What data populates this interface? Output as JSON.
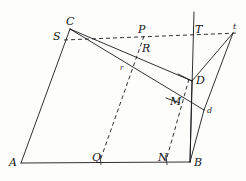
{
  "figure": {
    "kind": "geometry-diagram",
    "width": 246,
    "height": 181,
    "background_color": "#fdfdfb",
    "stroke_color": "#1a1a1e",
    "labels": [
      {
        "id": "C",
        "text": "C",
        "x": 66,
        "y": 16,
        "size": "lg"
      },
      {
        "id": "S",
        "text": "S",
        "x": 53,
        "y": 31,
        "size": "lg"
      },
      {
        "id": "P",
        "text": "P",
        "x": 138,
        "y": 24,
        "size": "lg"
      },
      {
        "id": "T",
        "text": "T",
        "x": 195,
        "y": 24,
        "size": "lg"
      },
      {
        "id": "t",
        "text": "t",
        "x": 233,
        "y": 23,
        "size": "sm"
      },
      {
        "id": "R",
        "text": "R",
        "x": 142,
        "y": 43,
        "size": "lg"
      },
      {
        "id": "r",
        "text": "r",
        "x": 120,
        "y": 65,
        "size": "xs"
      },
      {
        "id": "D",
        "text": "D",
        "x": 196,
        "y": 75,
        "size": "lg"
      },
      {
        "id": "M",
        "text": "M",
        "x": 170,
        "y": 96,
        "size": "lg"
      },
      {
        "id": "d",
        "text": "d",
        "x": 207,
        "y": 107,
        "size": "sm"
      },
      {
        "id": "A",
        "text": "A",
        "x": 9,
        "y": 157,
        "size": "lg"
      },
      {
        "id": "Q",
        "text": "Q",
        "x": 92,
        "y": 152,
        "size": "lg"
      },
      {
        "id": "N",
        "text": "N",
        "x": 158,
        "y": 152,
        "size": "lg"
      },
      {
        "id": "B",
        "text": "B",
        "x": 194,
        "y": 157,
        "size": "lg"
      }
    ],
    "points": {
      "A": [
        21,
        163
      ],
      "B": [
        190,
        162
      ],
      "C": [
        70,
        29
      ],
      "D": [
        192,
        81
      ],
      "d": [
        204,
        110
      ],
      "M": [
        180,
        103
      ],
      "N": [
        166,
        161
      ],
      "P": [
        144,
        36
      ],
      "Q": [
        100,
        161
      ],
      "R": [
        143,
        46
      ],
      "r": [
        126,
        71
      ],
      "S": [
        64,
        40
      ],
      "T": [
        196,
        35
      ],
      "t": [
        233,
        33
      ],
      "topline_apex": [
        194,
        12
      ],
      "dash_right_end": [
        238,
        33
      ]
    },
    "solid_segments": [
      {
        "name": "side-AC",
        "from": "A",
        "to": "C"
      },
      {
        "name": "base-AB",
        "from": "A",
        "to": "B"
      },
      {
        "name": "chord-CD",
        "from": "C",
        "to": "D"
      },
      {
        "name": "chord-Cd",
        "from": "C",
        "to": "d"
      },
      {
        "name": "segment-DB",
        "from": "D",
        "to": "B"
      },
      {
        "name": "segment-dB",
        "from": "d",
        "to": "B"
      },
      {
        "name": "segment-Dt",
        "from": "D",
        "to": "t"
      },
      {
        "name": "segment-dt",
        "from": "d",
        "to": "t"
      },
      {
        "name": "vertical-apex-B",
        "from": "topline_apex",
        "to": "B"
      }
    ],
    "dashed_segments": [
      {
        "name": "horizontal-S-t",
        "from": "S",
        "to": "dash_right_end"
      },
      {
        "name": "diagonal-P-Q",
        "from": "P",
        "to": "Q"
      },
      {
        "name": "diagonal-D-N",
        "from": "D",
        "to": "N"
      }
    ]
  }
}
